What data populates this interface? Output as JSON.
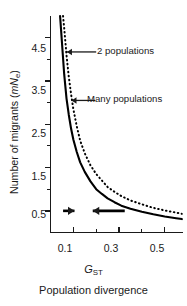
{
  "chart_data": {
    "type": "line",
    "title": "",
    "xlabel": "GST",
    "xlabel_caption": "Population divergence",
    "ylabel": "Number of migrants (mNe)",
    "xlim": [
      0.0,
      0.58
    ],
    "ylim": [
      0.0,
      5.0
    ],
    "grid": false,
    "legend_position": "inline-annotations",
    "x_ticks_major": [
      0.1,
      0.3,
      0.5
    ],
    "x_ticks_minor": [
      0.2,
      0.4
    ],
    "x_tick_labels": [
      "0.1",
      "0.3",
      "0.5"
    ],
    "y_ticks_major": [
      0.5,
      1.5,
      2.5,
      3.5,
      4.5
    ],
    "y_ticks_minor": [
      1.0,
      2.0,
      3.0,
      4.0
    ],
    "y_tick_labels": [
      "0.5",
      "1.5",
      "2.5",
      "3.5",
      "4.5"
    ],
    "series": [
      {
        "name": "2 populations",
        "style": "dotted",
        "formula": "mNe = (1 - GST) / (2 * GST)",
        "x": [
          0.055,
          0.06,
          0.07,
          0.08,
          0.09,
          0.1,
          0.115,
          0.13,
          0.15,
          0.175,
          0.2,
          0.225,
          0.25,
          0.28,
          0.31,
          0.35,
          0.4,
          0.45,
          0.5,
          0.55,
          0.575
        ],
        "y": [
          5.0,
          4.72,
          4.1,
          3.6,
          3.2,
          2.85,
          2.45,
          2.12,
          1.83,
          1.55,
          1.35,
          1.2,
          1.05,
          0.94,
          0.84,
          0.74,
          0.65,
          0.57,
          0.51,
          0.46,
          0.43
        ]
      },
      {
        "name": "Many populations",
        "style": "solid",
        "formula": "mNe = (1 - GST) / (4 * GST)",
        "x": [
          0.042,
          0.05,
          0.06,
          0.07,
          0.08,
          0.09,
          0.1,
          0.115,
          0.13,
          0.15,
          0.175,
          0.2,
          0.225,
          0.25,
          0.28,
          0.31,
          0.35,
          0.4,
          0.45,
          0.5,
          0.55,
          0.575
        ],
        "y": [
          5.0,
          4.4,
          3.65,
          3.1,
          2.72,
          2.4,
          2.15,
          1.86,
          1.62,
          1.4,
          1.18,
          1.0,
          0.89,
          0.79,
          0.7,
          0.62,
          0.55,
          0.48,
          0.42,
          0.37,
          0.33,
          0.31
        ]
      }
    ],
    "annotations": [
      {
        "id": "ann-2-populations",
        "text": "2 populations",
        "points_to_series": "2 populations",
        "arrow_direction": "left",
        "target_x": 0.072,
        "target_y": 4.17,
        "label_x": 0.2,
        "label_y": 4.17
      },
      {
        "id": "ann-many-populations",
        "text": "Many populations",
        "points_to_series": "Many populations",
        "arrow_direction": "left",
        "target_x": 0.092,
        "target_y": 3.05,
        "label_x": 0.195,
        "label_y": 3.05
      },
      {
        "id": "ann-arrow-left-bold",
        "text": "",
        "arrow_direction": "right",
        "target_x": 0.105,
        "target_y": 0.5,
        "label_x": 0.055,
        "label_y": 0.5
      },
      {
        "id": "ann-arrow-right-bold",
        "text": "",
        "arrow_direction": "left",
        "target_x": 0.185,
        "target_y": 0.5,
        "label_x": 0.325,
        "label_y": 0.5
      }
    ],
    "colors": {
      "axis": "#1a1a1a",
      "curve": "#000000",
      "background": "#ffffff"
    }
  },
  "axes": {
    "y_title_prefix": "Number of migrants (",
    "y_title_m": "m",
    "y_title_N": "N",
    "y_title_e": "e",
    "y_title_suffix": ")",
    "x_title_G": "G",
    "x_title_ST": "ST",
    "x_caption": "Population divergence"
  },
  "tick_text": {
    "y": [
      "4.5",
      "3.5",
      "2.5",
      "1.5",
      "0.5"
    ],
    "x": [
      "0.1",
      "0.3",
      "0.5"
    ]
  },
  "annotation_text": {
    "two_populations": "2 populations",
    "many_populations": "Many populations"
  }
}
